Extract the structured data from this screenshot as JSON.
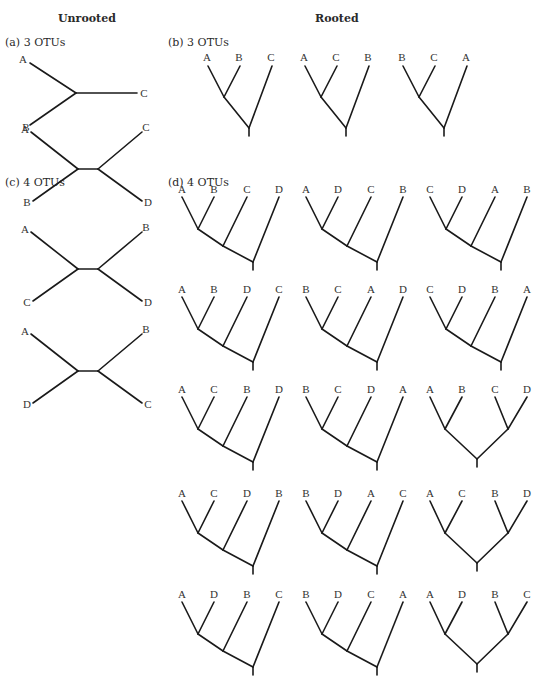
{
  "headers": {
    "unrooted": "Unrooted",
    "rooted": "Rooted"
  },
  "panels": {
    "a": "(a)  3 OTUs",
    "b": "(b)  3 OTUs",
    "c": "(c)  4 OTUs",
    "d": "(d)  4 OTUs"
  },
  "unrooted_3": {
    "tips": [
      "A",
      "B",
      "C"
    ]
  },
  "unrooted_4": [
    {
      "left_top": "A",
      "left_bottom": "B",
      "right_top": "C",
      "right_bottom": "D"
    },
    {
      "left_top": "A",
      "left_bottom": "C",
      "right_top": "B",
      "right_bottom": "D"
    },
    {
      "left_top": "A",
      "left_bottom": "D",
      "right_top": "B",
      "right_bottom": "C"
    }
  ],
  "rooted_3": [
    {
      "tips": [
        "A",
        "B",
        "C"
      ]
    },
    {
      "tips": [
        "A",
        "C",
        "B"
      ]
    },
    {
      "tips": [
        "B",
        "C",
        "A"
      ]
    }
  ],
  "rooted_4": [
    {
      "tips": [
        "A",
        "B",
        "C",
        "D"
      ],
      "shape": "pectinate"
    },
    {
      "tips": [
        "A",
        "D",
        "C",
        "B"
      ],
      "shape": "pectinate"
    },
    {
      "tips": [
        "C",
        "D",
        "A",
        "B"
      ],
      "shape": "pectinate"
    },
    {
      "tips": [
        "A",
        "B",
        "D",
        "C"
      ],
      "shape": "pectinate"
    },
    {
      "tips": [
        "B",
        "C",
        "A",
        "D"
      ],
      "shape": "pectinate"
    },
    {
      "tips": [
        "C",
        "D",
        "B",
        "A"
      ],
      "shape": "pectinate"
    },
    {
      "tips": [
        "A",
        "C",
        "B",
        "D"
      ],
      "shape": "pectinate"
    },
    {
      "tips": [
        "B",
        "C",
        "D",
        "A"
      ],
      "shape": "pectinate"
    },
    {
      "tips": [
        "A",
        "B",
        "C",
        "D"
      ],
      "shape": "balanced"
    },
    {
      "tips": [
        "A",
        "C",
        "D",
        "B"
      ],
      "shape": "pectinate"
    },
    {
      "tips": [
        "B",
        "D",
        "A",
        "C"
      ],
      "shape": "pectinate"
    },
    {
      "tips": [
        "A",
        "C",
        "B",
        "D"
      ],
      "shape": "balanced"
    },
    {
      "tips": [
        "A",
        "D",
        "B",
        "C"
      ],
      "shape": "pectinate"
    },
    {
      "tips": [
        "B",
        "D",
        "C",
        "A"
      ],
      "shape": "pectinate"
    },
    {
      "tips": [
        "A",
        "D",
        "B",
        "C"
      ],
      "shape": "balanced"
    }
  ]
}
